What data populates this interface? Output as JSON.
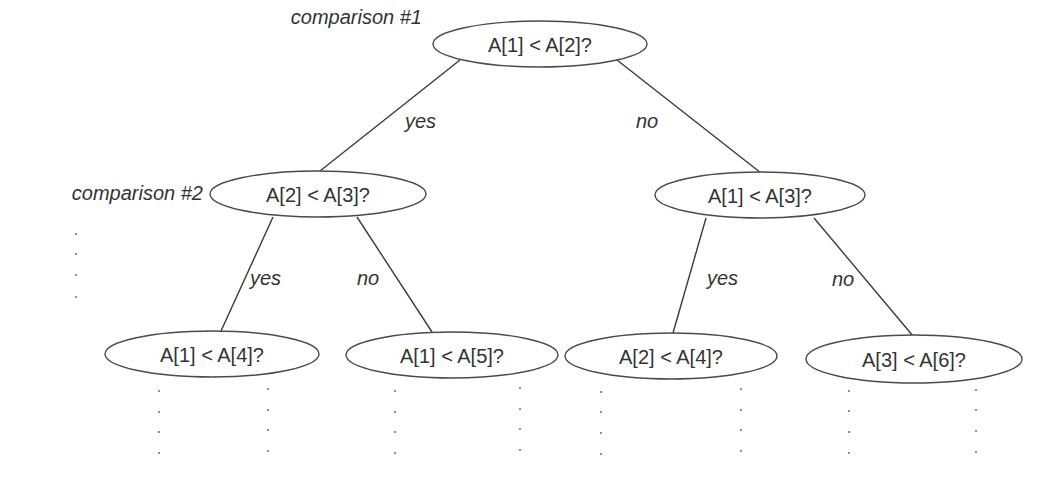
{
  "diagram": {
    "colors": {
      "stroke": "#4a4a4a",
      "text": "#333333",
      "dots": "#777777",
      "background": "#ffffff"
    },
    "level_labels": [
      {
        "id": "comparison-1",
        "text": "comparison #1",
        "x": 422,
        "y": 17
      },
      {
        "id": "comparison-2",
        "text": "comparison #2",
        "x": 203,
        "y": 193
      }
    ],
    "nodes": [
      {
        "id": "root",
        "label": "A[1] < A[2]?",
        "cx": 540,
        "cy": 44,
        "rx": 107,
        "ry": 23
      },
      {
        "id": "l2-left",
        "label": "A[2] < A[3]?",
        "cx": 318,
        "cy": 194,
        "rx": 108,
        "ry": 23
      },
      {
        "id": "l2-right",
        "label": "A[1] < A[3]?",
        "cx": 760,
        "cy": 195,
        "rx": 105,
        "ry": 23
      },
      {
        "id": "l3-1",
        "label": "A[1] < A[4]?",
        "cx": 212,
        "cy": 354,
        "rx": 107,
        "ry": 23
      },
      {
        "id": "l3-2",
        "label": "A[1] < A[5]?",
        "cx": 452,
        "cy": 355,
        "rx": 106,
        "ry": 23
      },
      {
        "id": "l3-3",
        "label": "A[2] < A[4]?",
        "cx": 671,
        "cy": 356,
        "rx": 106,
        "ry": 23
      },
      {
        "id": "l3-4",
        "label": "A[3] < A[6]?",
        "cx": 914,
        "cy": 359,
        "rx": 108,
        "ry": 24
      }
    ],
    "edges": [
      {
        "from": "root",
        "to": "l2-left",
        "label": "yes",
        "x1": 460,
        "y1": 60,
        "x2": 320,
        "y2": 171,
        "lx": 405,
        "ly": 121
      },
      {
        "from": "root",
        "to": "l2-right",
        "label": "no",
        "x1": 617,
        "y1": 60,
        "x2": 761,
        "y2": 173,
        "lx": 636,
        "ly": 121
      },
      {
        "from": "l2-left",
        "to": "l3-1",
        "label": "yes",
        "x1": 273,
        "y1": 217,
        "x2": 221,
        "y2": 331,
        "lx": 250,
        "ly": 278
      },
      {
        "from": "l2-left",
        "to": "l3-2",
        "label": "no",
        "x1": 357,
        "y1": 217,
        "x2": 432,
        "y2": 332,
        "lx": 357,
        "ly": 278
      },
      {
        "from": "l2-right",
        "to": "l3-3",
        "label": "yes",
        "x1": 706,
        "y1": 218,
        "x2": 673,
        "y2": 333,
        "lx": 707,
        "ly": 278
      },
      {
        "from": "l2-right",
        "to": "l3-4",
        "label": "no",
        "x1": 814,
        "y1": 218,
        "x2": 913,
        "y2": 336,
        "lx": 832,
        "ly": 279
      }
    ],
    "continuation_dots": [
      {
        "id": "left-margin",
        "x": 76,
        "ys": [
          234,
          254,
          275,
          297
        ]
      },
      {
        "id": "l3-1-left",
        "x": 159,
        "ys": [
          391,
          412,
          432,
          453
        ]
      },
      {
        "id": "l3-1-right",
        "x": 268,
        "ys": [
          389,
          410,
          430,
          451
        ]
      },
      {
        "id": "l3-2-left",
        "x": 395,
        "ys": [
          391,
          412,
          432,
          453
        ]
      },
      {
        "id": "l3-2-right",
        "x": 520,
        "ys": [
          388,
          409,
          429,
          450
        ]
      },
      {
        "id": "l3-3-left",
        "x": 601,
        "ys": [
          392,
          412,
          433,
          454
        ]
      },
      {
        "id": "l3-3-right",
        "x": 741,
        "ys": [
          389,
          410,
          430,
          451
        ]
      },
      {
        "id": "l3-4-left",
        "x": 849,
        "ys": [
          391,
          411,
          432,
          453
        ]
      },
      {
        "id": "l3-4-right",
        "x": 976,
        "ys": [
          390,
          410,
          431,
          452
        ]
      }
    ]
  }
}
